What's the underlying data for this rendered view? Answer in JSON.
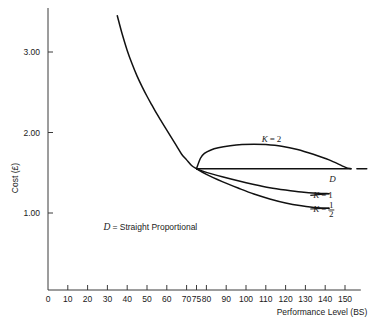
{
  "chart_data": {
    "type": "line",
    "title": "",
    "xlabel": "Performance Level (BS)",
    "ylabel": "Cost (£)",
    "xlim": [
      0,
      158
    ],
    "ylim": [
      0.55,
      3.45
    ],
    "grid": false,
    "legend_position": "inline-right",
    "xticks": [
      0,
      10,
      20,
      30,
      40,
      50,
      60,
      70,
      75,
      80,
      90,
      100,
      110,
      120,
      130,
      140,
      150
    ],
    "xtick_labels": [
      "0",
      "10",
      "20",
      "30",
      "40",
      "50",
      "60",
      "70",
      "75",
      "80",
      "90",
      "100",
      "110",
      "120",
      "130",
      "140",
      "150"
    ],
    "yticks": [
      1.0,
      2.0,
      3.0
    ],
    "ytick_labels": [
      "1.00",
      "2.00",
      "3.00"
    ],
    "convergence_point": {
      "x": 75,
      "y": 1.55
    },
    "annotations": [
      {
        "name": "legend-note",
        "text": "D = Straight Proportional",
        "symbol": "D",
        "body": "= Straight Proportional",
        "x": 28,
        "y": 0.79
      }
    ],
    "series": [
      {
        "name": "descending-cost-curve",
        "label": "",
        "points": [
          [
            35.0,
            3.45
          ],
          [
            37.5,
            3.22
          ],
          [
            40.0,
            3.02
          ],
          [
            42.5,
            2.85
          ],
          [
            45.0,
            2.7
          ],
          [
            47.5,
            2.57
          ],
          [
            50.0,
            2.45
          ],
          [
            52.5,
            2.34
          ],
          [
            55.0,
            2.23
          ],
          [
            57.5,
            2.13
          ],
          [
            60.0,
            2.03
          ],
          [
            62.5,
            1.93
          ],
          [
            65.0,
            1.83
          ],
          [
            67.5,
            1.73
          ],
          [
            70.0,
            1.66
          ],
          [
            72.5,
            1.59
          ],
          [
            75.0,
            1.55
          ]
        ]
      },
      {
        "name": "k-equals-2",
        "label": "K = 2",
        "label_symbol": "K",
        "label_value": "2",
        "label_x": 108,
        "label_y": 1.92,
        "points": [
          [
            75.0,
            1.55
          ],
          [
            77.0,
            1.68
          ],
          [
            79.0,
            1.74
          ],
          [
            82.0,
            1.78
          ],
          [
            86.0,
            1.81
          ],
          [
            92.0,
            1.835
          ],
          [
            98.0,
            1.85
          ],
          [
            104.0,
            1.855
          ],
          [
            110.0,
            1.85
          ],
          [
            118.0,
            1.83
          ],
          [
            126.0,
            1.79
          ],
          [
            134.0,
            1.73
          ],
          [
            142.0,
            1.66
          ],
          [
            150.0,
            1.57
          ],
          [
            153.0,
            1.55
          ]
        ]
      },
      {
        "name": "straight-proportional-D",
        "label": "D",
        "label_x": 142,
        "label_y": 1.42,
        "points": [
          [
            75.0,
            1.55
          ],
          [
            153.0,
            1.55
          ]
        ],
        "dash_segment": [
          [
            156.0,
            1.55
          ],
          [
            161.0,
            1.55
          ]
        ]
      },
      {
        "name": "k-equals-1",
        "label": "K = 1",
        "label_symbol": "K",
        "label_value": "1",
        "label_x": 134,
        "label_y": 1.22,
        "points": [
          [
            75.0,
            1.55
          ],
          [
            80.0,
            1.505
          ],
          [
            88.0,
            1.45
          ],
          [
            96.0,
            1.4
          ],
          [
            104.0,
            1.355
          ],
          [
            112.0,
            1.315
          ],
          [
            120.0,
            1.285
          ],
          [
            128.0,
            1.26
          ],
          [
            136.0,
            1.245
          ],
          [
            142.0,
            1.24
          ]
        ]
      },
      {
        "name": "k-equals-half",
        "label": "K = 1/2",
        "label_symbol": "K",
        "label_numerator": "1",
        "label_denominator": "2",
        "label_x": 134,
        "label_y": 1.05,
        "points": [
          [
            75.0,
            1.55
          ],
          [
            80.0,
            1.48
          ],
          [
            88.0,
            1.39
          ],
          [
            96.0,
            1.31
          ],
          [
            104.0,
            1.235
          ],
          [
            112.0,
            1.175
          ],
          [
            120.0,
            1.125
          ],
          [
            128.0,
            1.09
          ],
          [
            136.0,
            1.065
          ],
          [
            142.0,
            1.06
          ]
        ]
      }
    ]
  }
}
